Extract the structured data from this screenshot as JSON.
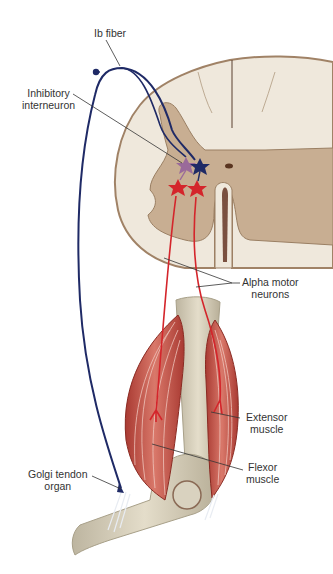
{
  "diagram": {
    "labels": {
      "ib_fiber": "Ib fiber",
      "inhibitory_interneuron_line1": "Inhibitory",
      "inhibitory_interneuron_line2": "interneuron",
      "alpha_motor_line1": "Alpha motor",
      "alpha_motor_line2": "neurons",
      "extensor_line1": "Extensor",
      "extensor_line2": "muscle",
      "flexor_line1": "Flexor",
      "flexor_line2": "muscle",
      "golgi_line1": "Golgi tendon",
      "golgi_line2": "organ"
    },
    "colors": {
      "ib_fiber": "#1f2a66",
      "interneuron": "#9a6a9a",
      "motor_neuron": "#d4252b",
      "gray_matter": "#c8ae92",
      "white_matter": "#efe8dc",
      "cord_outline": "#a08266",
      "muscle": "#c4574a",
      "bone": "#d9d2bf",
      "leader_line": "#333333"
    }
  }
}
